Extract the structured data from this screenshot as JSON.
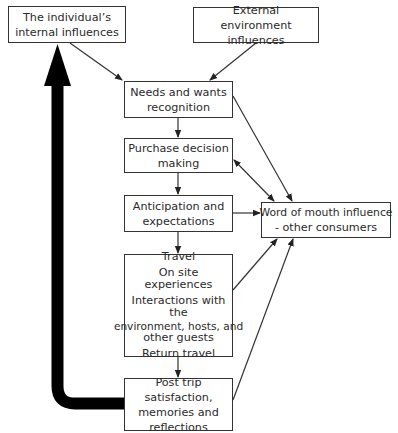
{
  "diagram": {
    "type": "flowchart",
    "nodes": {
      "internal": {
        "lines": [
          "The individual’s",
          "internal influences"
        ]
      },
      "external": {
        "lines": [
          "External environment",
          "influences"
        ]
      },
      "needs": {
        "lines": [
          "Needs and wants",
          "recognition"
        ]
      },
      "purchase": {
        "lines": [
          "Purchase decision",
          "making"
        ]
      },
      "anticipation": {
        "lines": [
          "Anticipation and",
          "expectations"
        ]
      },
      "travel": {
        "lines": [
          "Travel",
          "On site experiences",
          "Interactions with the",
          "environment, hosts, and",
          "other guests",
          "Return travel"
        ]
      },
      "posttrip": {
        "lines": [
          "Post trip satisfaction,",
          "memories and",
          "reflections"
        ]
      },
      "wom": {
        "lines": [
          "Word of mouth influence",
          "- other consumers"
        ]
      }
    },
    "edges": [
      {
        "from": "internal",
        "to": "needs"
      },
      {
        "from": "external",
        "to": "needs"
      },
      {
        "from": "needs",
        "to": "purchase"
      },
      {
        "from": "purchase",
        "to": "anticipation"
      },
      {
        "from": "anticipation",
        "to": "travel"
      },
      {
        "from": "travel",
        "to": "posttrip"
      },
      {
        "from": "needs",
        "to": "wom"
      },
      {
        "from": "purchase",
        "to": "wom",
        "bidirectional": true
      },
      {
        "from": "anticipation",
        "to": "wom"
      },
      {
        "from": "travel",
        "to": "wom"
      },
      {
        "from": "posttrip",
        "to": "wom"
      },
      {
        "from": "posttrip",
        "to": "internal",
        "style": "thick-feedback"
      }
    ],
    "colors": {
      "line": "#333333",
      "feedback_arrow": "#000000",
      "background": "#ffffff"
    }
  }
}
